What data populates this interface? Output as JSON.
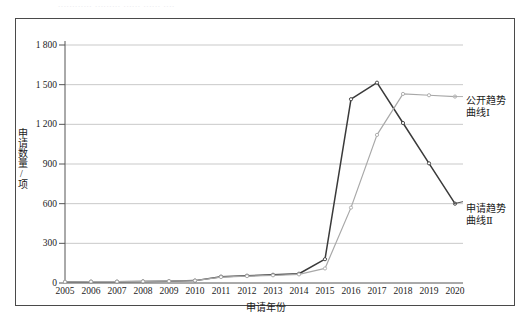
{
  "top_cut_text": "............ ......... ...... ...... ....",
  "axes": {
    "y_title": "申请数量/项",
    "x_title": "申请年份",
    "y_ticks": [
      "0",
      "300",
      "600",
      "900",
      "1 200",
      "1 500",
      "1 800"
    ],
    "x_ticks": [
      "2005",
      "2006",
      "2007",
      "2008",
      "2009",
      "2010",
      "2011",
      "2012",
      "2013",
      "2014",
      "2015",
      "2016",
      "2017",
      "2018",
      "2019",
      "2020"
    ]
  },
  "legend": {
    "series1_line1": "公开趋势",
    "series1_line2": "曲线Ⅰ",
    "series2_line1": "申请趋势",
    "series2_line2": "曲线Ⅱ"
  },
  "colors": {
    "series1": "#3a3a3a",
    "series2": "#a8a8a8",
    "gridline": "#c9c9c9",
    "axis": "#555555",
    "frame": "#4a4a4a"
  },
  "chart_data": {
    "type": "line",
    "title": "",
    "xlabel": "申请年份",
    "ylabel": "申请数量/项",
    "xlim": [
      2005,
      2020
    ],
    "ylim": [
      0,
      1800
    ],
    "ytick_values": [
      0,
      300,
      600,
      900,
      1200,
      1500,
      1800
    ],
    "grid": true,
    "legend_position": "right",
    "x": [
      2005,
      2006,
      2007,
      2008,
      2009,
      2010,
      2011,
      2012,
      2013,
      2014,
      2015,
      2016,
      2017,
      2018,
      2019,
      2020
    ],
    "series": [
      {
        "name": "公开趋势曲线Ⅰ",
        "color": "#3a3a3a",
        "values": [
          8,
          10,
          10,
          12,
          14,
          18,
          48,
          55,
          62,
          70,
          180,
          1390,
          1515,
          1210,
          905,
          600
        ]
      },
      {
        "name": "申请趋势曲线Ⅱ",
        "color": "#a8a8a8",
        "values": [
          8,
          10,
          10,
          12,
          14,
          18,
          45,
          52,
          58,
          65,
          110,
          570,
          1120,
          1430,
          1420,
          1410
        ]
      }
    ]
  }
}
